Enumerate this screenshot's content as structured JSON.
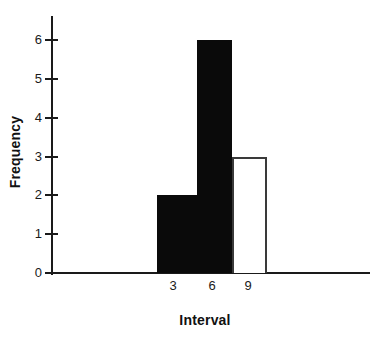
{
  "chart_data": {
    "type": "bar",
    "title": "",
    "subtitle": "",
    "xlabel": "Interval",
    "ylabel": "Frequency",
    "categories": [
      "3",
      "6",
      "9"
    ],
    "values": [
      2,
      6,
      3
    ],
    "series": [
      {
        "name": "Frequency",
        "values": [
          2,
          6,
          3
        ]
      }
    ],
    "bar_styles": [
      "filled",
      "filled",
      "hollow"
    ],
    "bar_fill_colors": [
      "#0a0a0a",
      "#0a0a0a",
      "#ffffff"
    ],
    "bar_edge_colors": [
      "#0a0a0a",
      "#0a0a0a",
      "#3a3a3a"
    ],
    "xlim": [
      0,
      4
    ],
    "ylim": [
      0,
      6.6
    ],
    "ytick_labels": [
      "0",
      "1",
      "2",
      "3",
      "4",
      "5",
      "6"
    ],
    "ytick_values": [
      0,
      1,
      2,
      3,
      4,
      5,
      6
    ],
    "xtick_labels": [
      "3",
      "6",
      "9"
    ],
    "grid": false,
    "legend": false,
    "legend_position": "none",
    "annotations": [],
    "axis_color": "#1a1a1a",
    "background_color": "#ffffff"
  },
  "axis_titles": {
    "y": "Frequency",
    "x": "Interval"
  },
  "ticks": {
    "y": [
      {
        "label": "6",
        "value": 6
      },
      {
        "label": "5",
        "value": 5
      },
      {
        "label": "4",
        "value": 4
      },
      {
        "label": "3",
        "value": 3
      },
      {
        "label": "2",
        "value": 2
      },
      {
        "label": "1",
        "value": 1
      },
      {
        "label": "0",
        "value": 0
      }
    ],
    "x": [
      {
        "label": "3"
      },
      {
        "label": "6"
      },
      {
        "label": "9"
      }
    ]
  },
  "bars": [
    {
      "label": "3",
      "value": 2,
      "style": "filled"
    },
    {
      "label": "6",
      "value": 6,
      "style": "filled"
    },
    {
      "label": "9",
      "value": 3,
      "style": "hollow"
    }
  ]
}
